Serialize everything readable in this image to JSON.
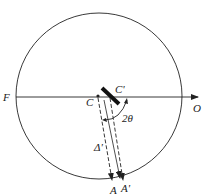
{
  "diagram": {
    "type": "geometric-optics-rotation",
    "labels": {
      "F": "F",
      "O": "O",
      "C": "C",
      "C_prime": "C'",
      "angle": "2θ",
      "A": "A",
      "A_prime": "A'",
      "delta": "Δ'"
    },
    "colors": {
      "stroke": "#222222",
      "background": "#ffffff"
    }
  }
}
